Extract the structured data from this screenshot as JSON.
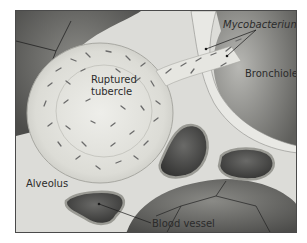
{
  "figure": {
    "type": "anatomical illustration",
    "labels": {
      "mycobacterium": "Mycobacterium",
      "bronchiole": "Bronchiole",
      "ruptured_tubercle_line1": "Ruptured",
      "ruptured_tubercle_line2": "tubercle",
      "alveolus": "Alveolus",
      "blood_vessel": "Blood vessel"
    },
    "colors": {
      "background_tissue": "#d9d9d6",
      "dark_alveolus": "#5a5a5a",
      "tubercle": "#e3e3de",
      "bacteria": "#6b6b6b",
      "vessel_interior": "#3f3f3f",
      "vessel_wall": "#9a9a94",
      "frame_border": "#4a4a4a",
      "label_text": "#2b2b2b"
    }
  }
}
